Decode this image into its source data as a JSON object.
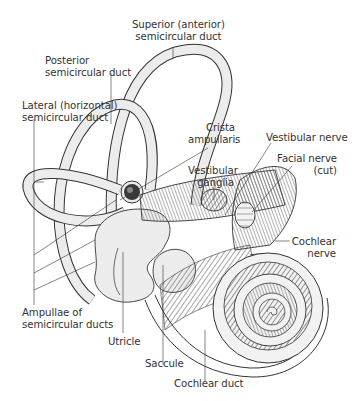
{
  "figure": {
    "colors": {
      "background": "#ffffff",
      "ink": "#333333",
      "membrane_fill": "#ececec",
      "nerve_fill": "#8a8a8a"
    },
    "labels": {
      "superior_duct": {
        "line1": "Superior (anterior)",
        "line2": "semicircular duct"
      },
      "posterior_duct": {
        "line1": "Posterior",
        "line2": "semicircular duct"
      },
      "lateral_duct": {
        "line1": "Lateral (horizontal)",
        "line2": "semicircular duct"
      },
      "crista": {
        "line1": "Crista",
        "line2": "ampullaris"
      },
      "vestibular_nerve": {
        "line1": "Vestibular nerve"
      },
      "facial_nerve": {
        "line1": "Facial nerve",
        "line2": "(cut)"
      },
      "vestibular_ganglia": {
        "line1": "Vestibular",
        "line2": "ganglia"
      },
      "cochlear_nerve": {
        "line1": "Cochlear",
        "line2": "nerve"
      },
      "ampullae": {
        "line1": "Ampullae of",
        "line2": "semicircular ducts"
      },
      "utricle": {
        "line1": "Utricle"
      },
      "saccule": {
        "line1": "Saccule"
      },
      "cochlear_duct": {
        "line1": "Cochlear duct"
      }
    }
  }
}
